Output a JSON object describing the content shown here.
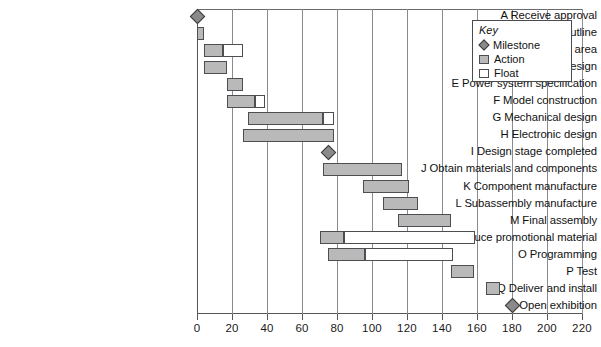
{
  "chart_data": {
    "type": "bar",
    "chart_kind": "gantt",
    "title": "",
    "xlabel": "",
    "ylabel": "",
    "xlim": [
      0,
      220
    ],
    "xticks": [
      0,
      20,
      40,
      60,
      80,
      100,
      120,
      140,
      160,
      180,
      200,
      220
    ],
    "xtick_labels": [
      "0",
      "20",
      "40",
      "60",
      "80",
      "100",
      "120",
      "140",
      "160",
      "180",
      "200",
      "220"
    ],
    "grid": "vertical",
    "legend_position": "top-right",
    "categories": [
      "A Receive approval",
      "B Agree project outline",
      "C Equip working area",
      "D Schematic design",
      "E Power system specification",
      "F Model construction",
      "G Mechanical design",
      "H Electronic design",
      "I Design stage completed",
      "J Obtain materials and components",
      "K Component manufacture",
      "L Subassembly manufacture",
      "M Final assembly",
      "N Produce promotional material",
      "O Programming",
      "P Test",
      "Q Deliver and install",
      "R Open exhibition"
    ],
    "tasks": [
      {
        "id": "A",
        "label": "A Receive approval",
        "type": "milestone",
        "at": 0
      },
      {
        "id": "B",
        "label": "B Agree project outline",
        "type": "bar",
        "action_start": 0,
        "action_end": 4,
        "float_end": 4
      },
      {
        "id": "C",
        "label": "C Equip working area",
        "type": "bar",
        "action_start": 4,
        "action_end": 15,
        "float_end": 26
      },
      {
        "id": "D",
        "label": "D Schematic design",
        "type": "bar",
        "action_start": 4,
        "action_end": 17,
        "float_end": 17
      },
      {
        "id": "E",
        "label": "E Power system specification",
        "type": "bar",
        "action_start": 17,
        "action_end": 26,
        "float_end": 26
      },
      {
        "id": "F",
        "label": "F Model construction",
        "type": "bar",
        "action_start": 17,
        "action_end": 33,
        "float_end": 39
      },
      {
        "id": "G",
        "label": "G Mechanical design",
        "type": "bar",
        "action_start": 29,
        "action_end": 72,
        "float_end": 78
      },
      {
        "id": "H",
        "label": "H Electronic design",
        "type": "bar",
        "action_start": 26,
        "action_end": 78,
        "float_end": 78
      },
      {
        "id": "I",
        "label": "I Design stage completed",
        "type": "milestone",
        "at": 75
      },
      {
        "id": "J",
        "label": "J Obtain materials and components",
        "type": "bar",
        "action_start": 72,
        "action_end": 117,
        "float_end": 117
      },
      {
        "id": "K",
        "label": "K Component manufacture",
        "type": "bar",
        "action_start": 95,
        "action_end": 121,
        "float_end": 121
      },
      {
        "id": "L",
        "label": "L Subassembly manufacture",
        "type": "bar",
        "action_start": 106,
        "action_end": 126,
        "float_end": 126
      },
      {
        "id": "M",
        "label": "M Final assembly",
        "type": "bar",
        "action_start": 115,
        "action_end": 145,
        "float_end": 145
      },
      {
        "id": "N",
        "label": "N Produce promotional material",
        "type": "bar",
        "action_start": 70,
        "action_end": 84,
        "float_end": 159
      },
      {
        "id": "O",
        "label": "O Programming",
        "type": "bar",
        "action_start": 75,
        "action_end": 96,
        "float_end": 146
      },
      {
        "id": "P",
        "label": "P Test",
        "type": "bar",
        "action_start": 145,
        "action_end": 158,
        "float_end": 158
      },
      {
        "id": "Q",
        "label": "Q Deliver and install",
        "type": "bar",
        "action_start": 165,
        "action_end": 173,
        "float_end": 173
      },
      {
        "id": "R",
        "label": "R Open exhibition",
        "type": "milestone",
        "at": 180
      }
    ]
  },
  "legend": {
    "title": "Key",
    "items": [
      {
        "label": "Milestone",
        "swatch": "milestone-diamond",
        "color": "#8a8a8a"
      },
      {
        "label": "Action",
        "swatch": "action-square",
        "color": "#b9b9b9"
      },
      {
        "label": "Float",
        "swatch": "float-square",
        "color": "#ffffff"
      }
    ]
  },
  "colors": {
    "action_fill": "#b9b9b9",
    "float_fill": "#ffffff",
    "milestone_fill": "#8a8a8a",
    "line": "#4d4e51",
    "gridline": "#8a8b8f"
  }
}
